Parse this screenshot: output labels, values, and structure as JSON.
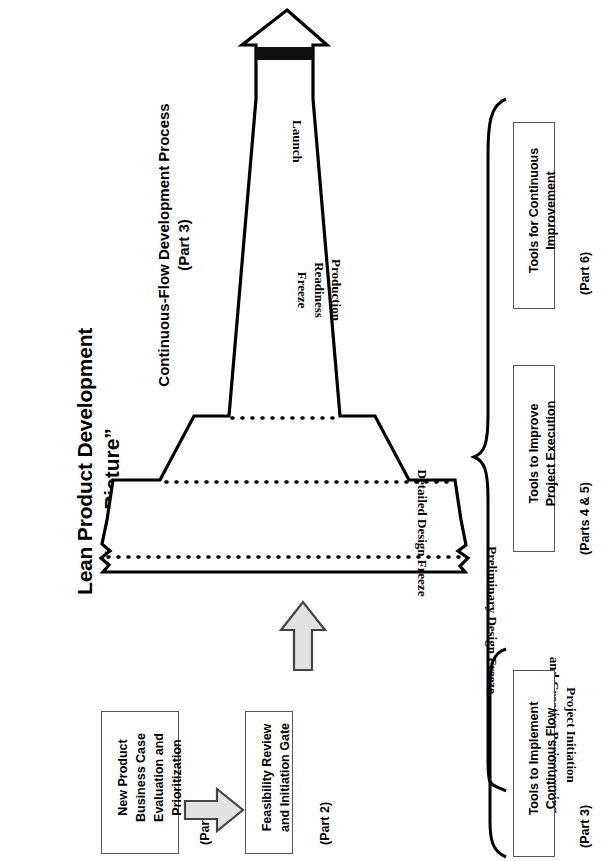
{
  "title": {
    "line1": "Lean Product Development",
    "line2": "“Big Picture”"
  },
  "process_heading": {
    "line1": "Continuous-Flow Development Process",
    "line2": "(Part 3)"
  },
  "pyramid": {
    "launch": "Launch",
    "production_readiness_freeze_line1": "Production",
    "production_readiness_freeze_line2": "Readiness",
    "production_readiness_freeze_line3": "Freeze",
    "detailed_design_freeze": "Detailed Design Freeze",
    "preliminary_design_freeze": "Preliminary Design Freeze",
    "project_initiation_line1": "Project Initiation",
    "project_initiation_line2": "and Creative Brainstorming"
  },
  "side_boxes": [
    {
      "id": "continuous-improvement",
      "line1": "Tools for Continuous",
      "line2": "Improvement",
      "part": "(Part 6)"
    },
    {
      "id": "project-execution",
      "line1": "Tools to Improve",
      "line2": "Project Execution",
      "part": "(Parts 4 & 5)"
    },
    {
      "id": "continuous-flow",
      "line1": "Tools to Implement",
      "line2": "Continuous Flow",
      "part": "(Part 3)"
    }
  ],
  "flow_boxes": [
    {
      "id": "new-product-business-case",
      "line1": "New Product",
      "line2": "Business Case",
      "line3": "Evaluation and",
      "line4": "Prioritization",
      "part": "(Part 2)"
    },
    {
      "id": "feasibility-review",
      "line1": "Feasibility Review",
      "line2": "and Initiation Gate",
      "part": "(Part 2)"
    }
  ],
  "colors": {
    "ink": "#000000",
    "box_border": "#555555",
    "arrow_fill": "#e2e2e2",
    "arrow_stroke": "#444444",
    "band_fill": "#111111",
    "page_bg": "#ffffff"
  }
}
